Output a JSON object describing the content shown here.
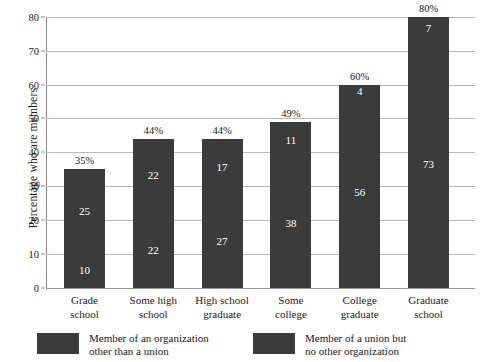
{
  "chart_data": {
    "type": "bar",
    "stacked": true,
    "title": "",
    "xlabel": "",
    "ylabel": "Percentage who are members",
    "ylim": [
      0,
      80
    ],
    "yticks": [
      0,
      10,
      20,
      30,
      40,
      50,
      60,
      70,
      80
    ],
    "grid": true,
    "categories": [
      "Grade school",
      "Some high school",
      "High school graduate",
      "Some college",
      "College graduate",
      "Graduate school"
    ],
    "category_lines": [
      [
        "Grade",
        "school"
      ],
      [
        "Some high",
        "school"
      ],
      [
        "High school",
        "graduate"
      ],
      [
        "Some",
        "college"
      ],
      [
        "College",
        "graduate"
      ],
      [
        "Graduate",
        "school"
      ]
    ],
    "series": [
      {
        "name": "Member of a union but no other organization",
        "values": [
          10,
          22,
          27,
          38,
          56,
          73
        ]
      },
      {
        "name": "Member of an organization other than a union",
        "values": [
          25,
          22,
          17,
          11,
          4,
          7
        ]
      }
    ],
    "totals": [
      35,
      44,
      44,
      49,
      60,
      80
    ],
    "total_labels": [
      "35%",
      "44%",
      "44%",
      "49%",
      "60%",
      "80%"
    ],
    "legend_position": "bottom",
    "bar_color": "#3b3b3b",
    "grid_color": "#b9b9b9",
    "text_color": "#1a1a1a"
  },
  "legend": {
    "items": [
      {
        "line1": "Member of an organization",
        "line2": "other than a union"
      },
      {
        "line1": "Member of a union but",
        "line2": "no other organization"
      }
    ]
  }
}
